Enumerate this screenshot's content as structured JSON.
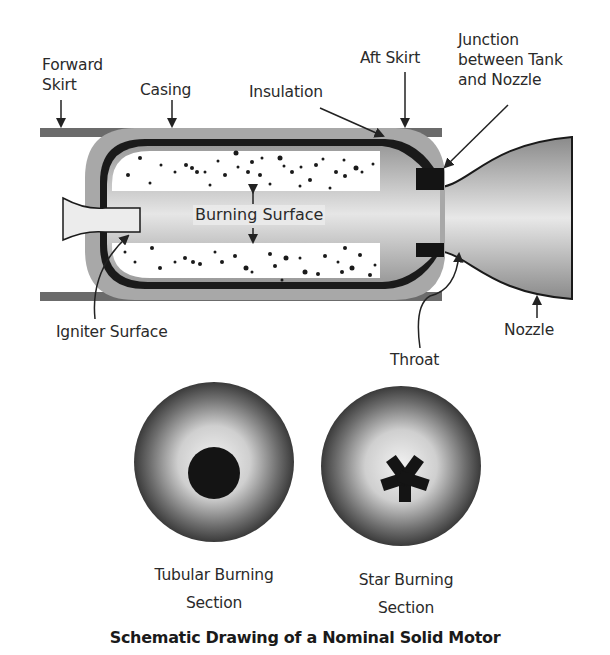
{
  "diagram": {
    "title": "Schematic Drawing of a Nominal Solid Motor",
    "labels": {
      "forward_skirt_line1": "Forward",
      "forward_skirt_line2": "Skirt",
      "casing": "Casing",
      "insulation": "Insulation",
      "aft_skirt": "Aft Skirt",
      "junction_line1": "Junction",
      "junction_line2": "between Tank",
      "junction_line3": "and Nozzle",
      "burning_surface": "Burning Surface",
      "igniter_surface": "Igniter Surface",
      "throat": "Throat",
      "nozzle": "Nozzle"
    },
    "sections": [
      {
        "name": "tubular",
        "line1": "Tubular Burning",
        "line2": "Section"
      },
      {
        "name": "star",
        "line1": "Star Burning",
        "line2": "Section"
      }
    ],
    "colors": {
      "skirt": "#6b6b6b",
      "insulation": "#a8a8a8",
      "casing": "#1a1a1a",
      "propellant": "#ffffff",
      "bore": "#d8d8d8",
      "junction": "#141414"
    }
  }
}
